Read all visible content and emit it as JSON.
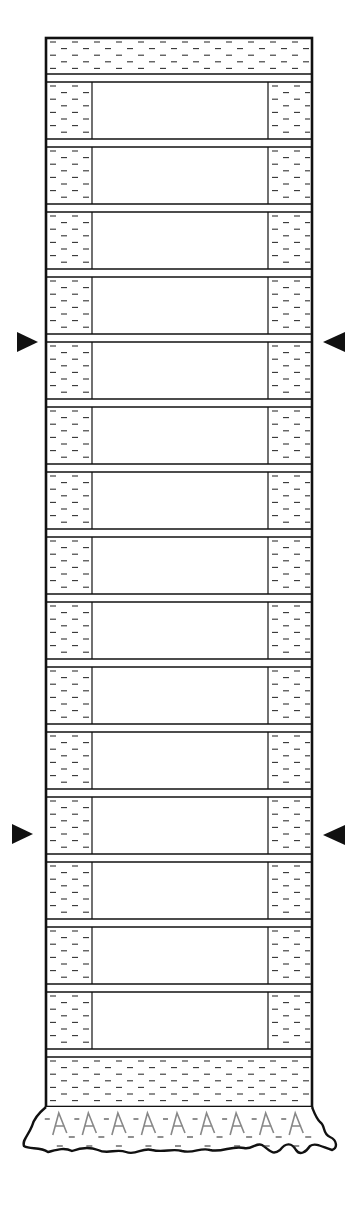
{
  "diagram": {
    "type": "stratigraphic column / layered section",
    "colors": {
      "line": "#111111",
      "fill": "#ffffff",
      "dash": "#333333",
      "foundation_mark": "#888888"
    },
    "frame": {
      "left": 46,
      "right": 312,
      "top": 38,
      "bottom": 1107
    },
    "top_band": {
      "y0": 38,
      "y1": 74,
      "pattern": "dashed-clay"
    },
    "cells": {
      "count": 15,
      "first_top": 82,
      "pitch": 65,
      "height": 57,
      "left_fill": {
        "x0": 46,
        "x1": 92,
        "pattern": "dashed-clay"
      },
      "right_fill": {
        "x0": 268,
        "x1": 312,
        "pattern": "dashed-clay"
      },
      "center": {
        "x0": 92,
        "x1": 268,
        "pattern": "blank"
      }
    },
    "bottom_band": {
      "y0": 1057,
      "y1": 1107,
      "pattern": "dashed-clay"
    },
    "foundation": {
      "y0": 1107,
      "y1": 1158,
      "pattern": "A-marks-with-dashes",
      "mark_count": 9
    },
    "markers": [
      {
        "side": "left",
        "y": 342,
        "direction": "right"
      },
      {
        "side": "right",
        "y": 342,
        "direction": "left"
      },
      {
        "side": "left",
        "y": 834,
        "direction": "right"
      },
      {
        "side": "right",
        "y": 835,
        "direction": "left"
      }
    ]
  }
}
